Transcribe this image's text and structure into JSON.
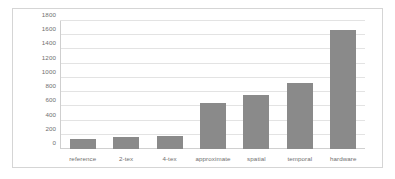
{
  "chart_data": {
    "type": "bar",
    "title": "",
    "xlabel": "",
    "ylabel": "",
    "categories": [
      "reference",
      "2-tex",
      "4-tex",
      "approximate",
      "spatial",
      "temporal",
      "hardware"
    ],
    "values": [
      135,
      165,
      180,
      645,
      765,
      930,
      1680
    ],
    "ylim": [
      0,
      1800
    ],
    "ytick_values": [
      0,
      200,
      400,
      600,
      800,
      1000,
      1200,
      1400,
      1600,
      1800
    ],
    "ytick_labels": [
      "0",
      "200",
      "400",
      "600",
      "800",
      "1000",
      "1200",
      "1400",
      "1600",
      "1800"
    ],
    "grid": true,
    "legend": "none",
    "bar_color": "#8a8a8a",
    "gridline_color": "#e3e3e3",
    "axis_color": "#cfcfcf",
    "label_color": "#6f6f6f",
    "frame_color": "#d5d5d5",
    "background": "#ffffff"
  }
}
